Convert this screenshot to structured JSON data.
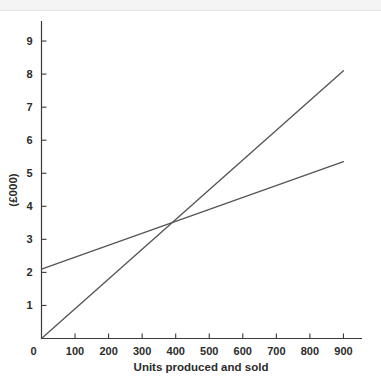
{
  "chart_data": {
    "type": "line",
    "title": "",
    "xlabel": "Units produced and sold",
    "ylabel": "(£000)",
    "xlim": [
      0,
      950
    ],
    "ylim": [
      0,
      9.6
    ],
    "grid": false,
    "legend": "none",
    "xticks": [
      "0",
      "100",
      "200",
      "300",
      "400",
      "500",
      "600",
      "700",
      "800",
      "900"
    ],
    "xtick_values": [
      0,
      100,
      200,
      300,
      400,
      500,
      600,
      700,
      800,
      900
    ],
    "yticks": [
      "1",
      "2",
      "3",
      "4",
      "5",
      "6",
      "7",
      "8",
      "9"
    ],
    "ytick_values": [
      1,
      2,
      3,
      4,
      5,
      6,
      7,
      8,
      9
    ],
    "series": [
      {
        "name": "sales-revenue-line",
        "color": "#555555",
        "x": [
          0,
          900
        ],
        "values": [
          0,
          8.1
        ]
      },
      {
        "name": "total-cost-line",
        "color": "#555555",
        "x": [
          0,
          900
        ],
        "values": [
          2.1,
          5.35
        ]
      }
    ],
    "annotations": [
      {
        "name": "break-even-intersection",
        "x": 400,
        "y": 3.55,
        "label": ""
      }
    ]
  },
  "axes": {
    "x_title": "Units produced and sold",
    "y_title": "(£000)"
  }
}
